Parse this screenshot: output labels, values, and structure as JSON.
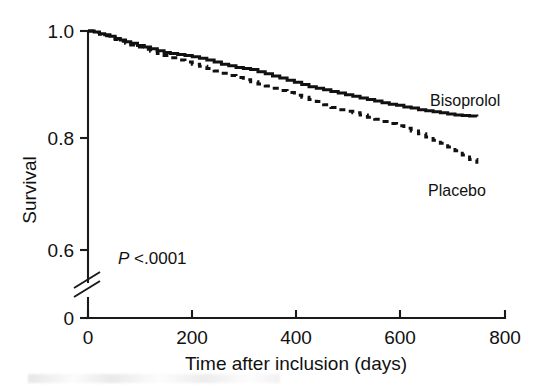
{
  "figure": {
    "name": "kaplan-meier-survival-curve",
    "annotation": {
      "p_prefix": "P",
      "p_value": " <.0001"
    }
  },
  "chart_data": {
    "type": "line",
    "title": "",
    "subtitle": "",
    "xlabel": "Time after inclusion (days)",
    "ylabel": "Survival",
    "xlim": [
      0,
      800
    ],
    "ylim": [
      0.55,
      1.0
    ],
    "xticks": [
      0,
      200,
      400,
      600,
      800
    ],
    "xtick_labels": [
      "0",
      "200",
      "400",
      "600",
      "800"
    ],
    "yticks": [
      1.0,
      0.8,
      0.6,
      0.0
    ],
    "ytick_labels": [
      "1.0",
      "0.8",
      "0.6",
      "0"
    ],
    "y_axis_break": true,
    "y_axis_break_label": "axis-break-between-0.6-and-0",
    "grid": false,
    "legend_position": "inline-right-of-curve-ends",
    "annotations": [
      {
        "text": "P <.0001",
        "x": 130,
        "y": 0.605
      }
    ],
    "series": [
      {
        "name": "Bisoprolol",
        "style": "solid",
        "label_x": 700,
        "label_y": 0.875,
        "points": [
          [
            0,
            1.0
          ],
          [
            12,
            0.998
          ],
          [
            22,
            0.995
          ],
          [
            32,
            0.993
          ],
          [
            42,
            0.99
          ],
          [
            52,
            0.986
          ],
          [
            62,
            0.983
          ],
          [
            72,
            0.98
          ],
          [
            82,
            0.977
          ],
          [
            95,
            0.973
          ],
          [
            108,
            0.97
          ],
          [
            120,
            0.967
          ],
          [
            133,
            0.963
          ],
          [
            146,
            0.96
          ],
          [
            158,
            0.958
          ],
          [
            172,
            0.956
          ],
          [
            186,
            0.954
          ],
          [
            200,
            0.952
          ],
          [
            214,
            0.949
          ],
          [
            228,
            0.946
          ],
          [
            242,
            0.942
          ],
          [
            256,
            0.938
          ],
          [
            270,
            0.935
          ],
          [
            284,
            0.932
          ],
          [
            298,
            0.93
          ],
          [
            312,
            0.928
          ],
          [
            326,
            0.924
          ],
          [
            340,
            0.92
          ],
          [
            354,
            0.916
          ],
          [
            368,
            0.912
          ],
          [
            382,
            0.908
          ],
          [
            396,
            0.904
          ],
          [
            410,
            0.9
          ],
          [
            424,
            0.896
          ],
          [
            438,
            0.893
          ],
          [
            452,
            0.89
          ],
          [
            466,
            0.887
          ],
          [
            480,
            0.884
          ],
          [
            494,
            0.881
          ],
          [
            508,
            0.878
          ],
          [
            522,
            0.875
          ],
          [
            536,
            0.872
          ],
          [
            550,
            0.869
          ],
          [
            564,
            0.866
          ],
          [
            578,
            0.863
          ],
          [
            592,
            0.861
          ],
          [
            606,
            0.858
          ],
          [
            620,
            0.856
          ],
          [
            634,
            0.853
          ],
          [
            648,
            0.851
          ],
          [
            662,
            0.849
          ],
          [
            676,
            0.847
          ],
          [
            690,
            0.845
          ],
          [
            704,
            0.843
          ],
          [
            718,
            0.842
          ],
          [
            732,
            0.841
          ],
          [
            746,
            0.84
          ]
        ]
      },
      {
        "name": "Placebo",
        "style": "dashed",
        "label_x": 700,
        "label_y": 0.775,
        "points": [
          [
            0,
            1.0
          ],
          [
            12,
            0.997
          ],
          [
            22,
            0.994
          ],
          [
            32,
            0.991
          ],
          [
            42,
            0.988
          ],
          [
            52,
            0.984
          ],
          [
            62,
            0.981
          ],
          [
            72,
            0.977
          ],
          [
            82,
            0.974
          ],
          [
            95,
            0.97
          ],
          [
            108,
            0.966
          ],
          [
            120,
            0.962
          ],
          [
            133,
            0.958
          ],
          [
            146,
            0.954
          ],
          [
            158,
            0.95
          ],
          [
            172,
            0.946
          ],
          [
            186,
            0.942
          ],
          [
            200,
            0.938
          ],
          [
            214,
            0.934
          ],
          [
            228,
            0.93
          ],
          [
            242,
            0.925
          ],
          [
            256,
            0.921
          ],
          [
            270,
            0.917
          ],
          [
            284,
            0.913
          ],
          [
            298,
            0.909
          ],
          [
            312,
            0.905
          ],
          [
            326,
            0.901
          ],
          [
            340,
            0.897
          ],
          [
            354,
            0.893
          ],
          [
            368,
            0.889
          ],
          [
            382,
            0.885
          ],
          [
            396,
            0.88
          ],
          [
            410,
            0.876
          ],
          [
            424,
            0.872
          ],
          [
            438,
            0.868
          ],
          [
            452,
            0.862
          ],
          [
            466,
            0.857
          ],
          [
            480,
            0.853
          ],
          [
            494,
            0.85
          ],
          [
            508,
            0.847
          ],
          [
            522,
            0.843
          ],
          [
            536,
            0.839
          ],
          [
            550,
            0.835
          ],
          [
            564,
            0.831
          ],
          [
            578,
            0.827
          ],
          [
            592,
            0.823
          ],
          [
            606,
            0.818
          ],
          [
            620,
            0.813
          ],
          [
            634,
            0.808
          ],
          [
            648,
            0.802
          ],
          [
            662,
            0.796
          ],
          [
            676,
            0.79
          ],
          [
            690,
            0.783
          ],
          [
            704,
            0.776
          ],
          [
            718,
            0.768
          ],
          [
            732,
            0.76
          ],
          [
            746,
            0.752
          ]
        ]
      }
    ]
  }
}
